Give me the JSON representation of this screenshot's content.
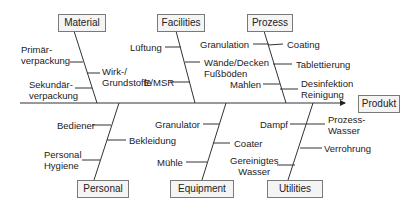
{
  "diagram": {
    "type": "fishbone",
    "effect": "Produkt",
    "categories": {
      "material": {
        "label": "Material",
        "causes": [
          "Primär-\nverpackung",
          "Wirk-/\nGrundstoffe",
          "Sekundär-\nverpackung"
        ]
      },
      "facilities": {
        "label": "Facilities",
        "causes": [
          "Lüftung",
          "Wände/Decken\nFußböden",
          "E/MSR"
        ]
      },
      "prozess": {
        "label": "Prozess",
        "causes": [
          "Granulation",
          "Coating",
          "Tablettierung",
          "Mahlen",
          "Desinfektion\nReinigung"
        ]
      },
      "personal": {
        "label": "Personal",
        "causes": [
          "Bediener",
          "Bekleidung",
          "Personal\nHygiene"
        ]
      },
      "equipment": {
        "label": "Equipment",
        "causes": [
          "Granulator",
          "Coater",
          "Mühle"
        ]
      },
      "utilities": {
        "label": "Utilities",
        "causes": [
          "Dampf",
          "Prozess-\nWasser",
          "Verrohrung",
          "Gereinigtes\nWasser"
        ]
      }
    },
    "colors": {
      "line": "#333333",
      "box_fill": "#f4f4f4",
      "box_border": "#7a7a7a"
    }
  }
}
